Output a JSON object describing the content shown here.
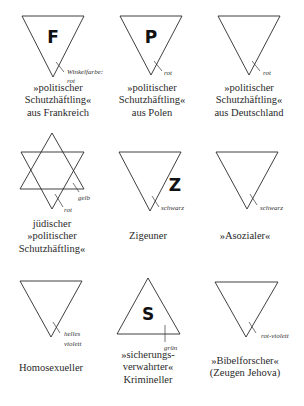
{
  "badges": [
    {
      "id": "political-france",
      "shape": "triangle-down",
      "letter": "F",
      "color_label": [
        "Winkelfarbe:",
        "rot"
      ],
      "color": "#d22b2b",
      "caption": [
        "»politischer",
        "Schutzhäftling«",
        "aus Frankreich"
      ]
    },
    {
      "id": "political-poland",
      "shape": "triangle-down",
      "letter": "P",
      "color_label": [
        "rot"
      ],
      "color": "#d22b2b",
      "caption": [
        "»politischer",
        "Schutzhäftling«",
        "aus Polen"
      ]
    },
    {
      "id": "political-germany",
      "shape": "triangle-down",
      "letter": "",
      "color_label": [
        "rot"
      ],
      "color": "#d22b2b",
      "caption": [
        "»politischer",
        "Schutzhäftling«",
        "aus Deutschland"
      ]
    },
    {
      "id": "jewish-political",
      "shape": "star-of-david",
      "letter": "",
      "color_label": [
        "rot",
        "gelb"
      ],
      "color": "#d22b2b",
      "secondary_color": "#f2c81e",
      "caption": [
        "jüdischer",
        "»politischer",
        "Schutzhäftling«"
      ]
    },
    {
      "id": "gypsy",
      "shape": "triangle-down",
      "letter": "Z",
      "color_label": [
        "schwarz"
      ],
      "color": "#111111",
      "caption": [
        "Zigeuner"
      ]
    },
    {
      "id": "asocial",
      "shape": "triangle-down",
      "letter": "",
      "color_label": [
        "schwarz"
      ],
      "color": "#111111",
      "caption": [
        "»Asozialer«"
      ]
    },
    {
      "id": "homosexual",
      "shape": "triangle-down",
      "letter": "",
      "color_label": [
        "helles",
        "violett"
      ],
      "color": "#e08ad8",
      "caption": [
        "Homosexueller"
      ]
    },
    {
      "id": "criminal",
      "shape": "triangle-up",
      "letter": "S",
      "color_label": [
        "grün"
      ],
      "color": "#2e9a3c",
      "caption": [
        "»sicherungs-",
        "verwahrter«",
        "Krimineller"
      ]
    },
    {
      "id": "jehovahs-witness",
      "shape": "triangle-down",
      "letter": "",
      "color_label": [
        "rot-violett"
      ],
      "color": "#a03a8a",
      "caption": [
        "»Bibelforscher«",
        "(Zeugen Jehova)"
      ]
    }
  ]
}
